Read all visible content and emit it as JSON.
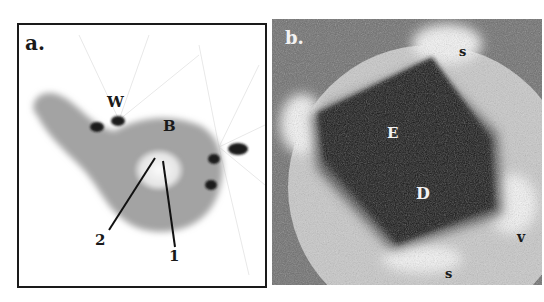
{
  "figure": {
    "panels": [
      {
        "id": "a",
        "panel_label": "a.",
        "annotations": {
          "W": "W",
          "B": "B",
          "pointer_2": "2",
          "pointer_1": "1"
        }
      },
      {
        "id": "b",
        "panel_label": "b.",
        "annotations": {
          "s_top": "s",
          "E": "E",
          "D": "D",
          "v": "v",
          "s_bottom": "s"
        }
      }
    ],
    "colors": {
      "blob_gray": "#a3a3a3",
      "spot_dark": "#1c1c1c",
      "texture_gray": "#6e6e6e",
      "region_dark": "#141414",
      "halo_light": "#d8d8d8"
    }
  }
}
